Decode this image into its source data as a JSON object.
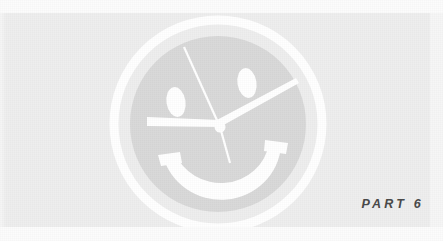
{
  "page": {
    "type": "book-part-divider",
    "width": 443,
    "height": 241,
    "background_color": "#fdfdfd",
    "band_color": "#eeeeee",
    "artwork_color": "#ffffff"
  },
  "label": {
    "text": "PART 6",
    "part_word": "PART",
    "part_number": "6",
    "color": "#4a4a4a",
    "style": "italic-bold-letterspaced"
  },
  "logo": {
    "name": "smiley-clock-logo",
    "description": "Smiley face combined with a clock face",
    "color": "#ffffff",
    "center_x": 218,
    "center_y": 124,
    "outer_ring": {
      "name": "outer-ring",
      "radius": 104,
      "stroke_width": 9
    },
    "face_disc": {
      "name": "face-disc",
      "radius": 88,
      "fill": "#d8d8d8"
    },
    "eyes": [
      {
        "name": "left-eye",
        "cx": 176,
        "cy": 102,
        "rx": 10,
        "ry": 15,
        "rotation": -8
      },
      {
        "name": "right-eye",
        "cx": 247,
        "cy": 83,
        "rx": 10,
        "ry": 15,
        "rotation": -8
      }
    ],
    "mouth": {
      "name": "smile-arc",
      "start_x": 166,
      "start_y": 160,
      "end_x": 279,
      "end_y": 152,
      "stroke_width": 11
    },
    "hands": [
      {
        "name": "clock-hand-minute",
        "angle_label": "up-right",
        "length": 92,
        "stroke_width": 6
      },
      {
        "name": "clock-hand-hour",
        "angle_label": "left",
        "length": 78,
        "stroke_width": 6
      },
      {
        "name": "clock-hand-second",
        "angle_label": "up-left",
        "length": 88,
        "stroke_width": 2
      },
      {
        "name": "clock-hand-tail",
        "angle_label": "down",
        "length": 36,
        "stroke_width": 2
      }
    ],
    "pivot": {
      "name": "clock-pivot",
      "cx": 220,
      "cy": 127,
      "r": 5
    }
  }
}
